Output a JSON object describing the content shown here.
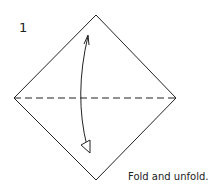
{
  "diagram": {
    "step_number": "1",
    "caption": "Fold and unfold.",
    "shape": "square-diamond",
    "fold_line": "valley-fold-dashed-horizontal",
    "arrow": "fold-and-unfold-arrow",
    "line_color": "#222222"
  }
}
